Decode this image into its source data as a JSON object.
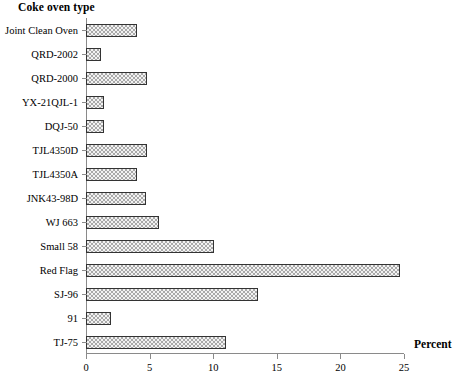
{
  "chart_data": {
    "type": "bar",
    "orientation": "horizontal",
    "title": "",
    "xlabel": "Percent",
    "ylabel": "Coke oven type",
    "xlim": [
      0,
      25
    ],
    "xticks": [
      0,
      5,
      10,
      15,
      20,
      25
    ],
    "xtick_labels": [
      "0",
      "5",
      "10",
      "15",
      "20",
      "25"
    ],
    "grid": false,
    "legend": null,
    "categories": [
      "Joint Clean Oven",
      "QRD-2002",
      "QRD-2000",
      "YX-21QJL-1",
      "DQJ-50",
      "TJL4350D",
      "TJL4350A",
      "JNK43-98D",
      "WJ 663",
      "Small 58",
      "Red Flag",
      "SJ-96",
      "91",
      "TJ-75"
    ],
    "values": [
      4.0,
      1.2,
      4.8,
      1.4,
      1.4,
      4.8,
      4.0,
      4.7,
      5.7,
      10.1,
      24.7,
      13.5,
      2.0,
      11.0
    ],
    "bar_fill_color": "#a9a9a9",
    "bar_border_color": "#333333",
    "axis_color": "#8a8a8a"
  }
}
